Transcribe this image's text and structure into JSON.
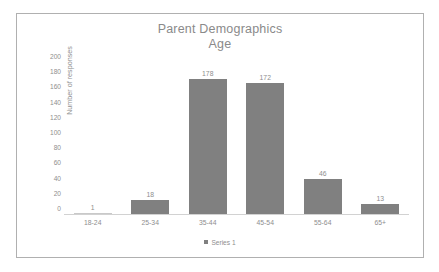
{
  "chart_data": {
    "type": "bar",
    "title": "Parent Demographics Age",
    "title_line1": "Parent Demographics",
    "title_line2": "Age",
    "categories": [
      "18-24",
      "25-34",
      "35-44",
      "45-54",
      "55-64",
      "65+"
    ],
    "values": [
      1,
      18,
      178,
      172,
      46,
      13
    ],
    "series": [
      {
        "name": "Series 1",
        "values": [
          1,
          18,
          178,
          172,
          46,
          13
        ]
      }
    ],
    "data_labels": [
      "1",
      "18",
      "178",
      "172",
      "46",
      "13"
    ],
    "xlabel": "",
    "ylabel": "Number of responses",
    "ylim": [
      0,
      200
    ],
    "ytick_step": 20,
    "yticks": [
      "200",
      "180",
      "160",
      "140",
      "120",
      "100",
      "80",
      "60",
      "40",
      "20",
      "0"
    ],
    "grid": false,
    "legend": {
      "position": "bottom",
      "entries": [
        "Series 1"
      ]
    },
    "colors": {
      "bar": "#808080",
      "text": "#8e8e8e",
      "title": "#8a8a8a",
      "axis_line": "#d2d2d2",
      "frame_border": "#b0b0b0",
      "background": "#ffffff"
    }
  }
}
